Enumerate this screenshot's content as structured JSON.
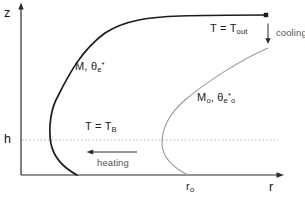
{
  "diagram": {
    "title_hint": "thermodynamic schematic in z-r plane",
    "colors": {
      "background": "#ffffff",
      "axis": "#2b2b2b",
      "main_curve": "#1c1c1c",
      "secondary_curve": "#9a9a9a",
      "dotted_line": "#b3b3b3",
      "text": "#1b1b1b",
      "small_text": "#555555"
    },
    "axes": {
      "z_label": "z",
      "r_label": "r",
      "h_label": "h",
      "r0": {
        "main": "r",
        "sub": "o"
      }
    },
    "labels": {
      "t_out": {
        "main": "T = T",
        "sub": "out"
      },
      "cooling": "cooling",
      "heating": "heating",
      "t_b": {
        "main": "T = T",
        "sub": "B"
      },
      "m": {
        "pre": "M, θ",
        "sub": "e",
        "sup": "*"
      },
      "m0": {
        "pre": "M",
        "presub": "o",
        "mid": ", θ",
        "sub": "e",
        "sup": "*",
        "postsub": "o"
      }
    },
    "paths": {
      "main_curve": "M 77 175 C 64 168 54 158 51 144 C 48 127 51 108 58 96 C 70 72 82 50 105 33 C 125 20 150 17 180 16 C 210 15 240 15 266 15",
      "secondary_curve": "M 268 48 C 240 60 205 83 185 100 C 170 113 162 127 162 143 C 162 157 172 167 188 175",
      "z_axis": {
        "x1": 21,
        "y1": 175,
        "x2": 21,
        "y2": 6
      },
      "r_axis": {
        "x1": 21,
        "y1": 175,
        "x2": 279,
        "y2": 175
      },
      "h_dotted": {
        "x1": 22,
        "y1": 140,
        "x2": 278,
        "y2": 140
      },
      "cooling_arrow": {
        "x1": 268,
        "y1": 23.5,
        "x2": 268,
        "y2": 39
      },
      "heating_arrow": {
        "x1": 137,
        "y1": 152,
        "x2": 92,
        "y2": 152
      }
    }
  }
}
